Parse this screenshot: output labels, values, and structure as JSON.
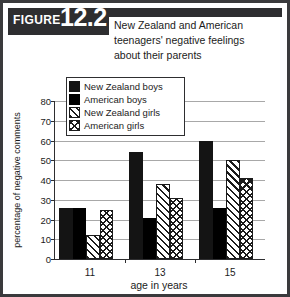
{
  "figure": {
    "badge_word": "FIGURE",
    "badge_number": "12.2",
    "title_lines": [
      "New Zealand and American",
      "teenagers' negative feelings",
      "about their parents"
    ]
  },
  "colors": {
    "frame": "#3a3a3c",
    "banner": "#2e2e30",
    "ink": "#1b1b1b",
    "grid": "#a8a8a8",
    "series_new_zealand_boys": "#141414",
    "series_american_boys": "#000000",
    "series_new_zealand_girls": "#ffffff",
    "series_american_girls": "#ffffff"
  },
  "chart_data": {
    "type": "bar",
    "title": "New Zealand and American teenagers' negative feelings about their parents",
    "xlabel": "age in years",
    "ylabel": "percentage of negative comments",
    "categories": [
      "11",
      "13",
      "15"
    ],
    "ylim": [
      0,
      80
    ],
    "yticks": [
      0,
      10,
      20,
      30,
      40,
      50,
      60,
      70,
      80
    ],
    "ytick_labels": [
      "0",
      "10",
      "20",
      "30",
      "40",
      "50",
      "60",
      "70",
      "80"
    ],
    "grid": true,
    "legend_position": "upper-left-inside",
    "series": [
      {
        "name": "New Zealand boys",
        "pattern": "solid-black",
        "values": [
          26,
          54,
          60
        ]
      },
      {
        "name": "American boys",
        "pattern": "solid-black",
        "values": [
          26,
          21,
          26
        ]
      },
      {
        "name": "New Zealand girls",
        "pattern": "diagonal-hatch",
        "values": [
          12,
          38,
          50
        ]
      },
      {
        "name": "American girls",
        "pattern": "crosshatch",
        "values": [
          25,
          31,
          41
        ]
      }
    ]
  }
}
